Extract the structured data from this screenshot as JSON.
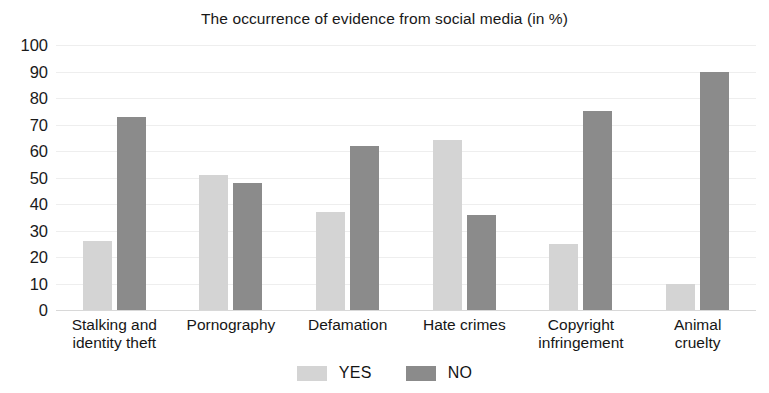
{
  "chart_data": {
    "type": "bar",
    "title": "The occurrence of evidence from social media (in %)",
    "xlabel": "",
    "ylabel": "",
    "ylim": [
      0,
      100
    ],
    "yticks": [
      0,
      10,
      20,
      30,
      40,
      50,
      60,
      70,
      80,
      90,
      100
    ],
    "ytick_labels": [
      "0",
      "10",
      "20",
      "30",
      "40",
      "50",
      "60",
      "70",
      "80",
      "90",
      "100"
    ],
    "grid": true,
    "legend_position": "bottom",
    "categories": [
      "Stalking and identity theft",
      "Pornography",
      "Defamation",
      "Hate crimes",
      "Copyright infringement",
      "Animal cruelty"
    ],
    "category_lines": [
      [
        "Stalking and",
        "identity theft"
      ],
      [
        "Pornography",
        ""
      ],
      [
        "Defamation",
        ""
      ],
      [
        "Hate crimes",
        ""
      ],
      [
        "Copyright",
        "infringement"
      ],
      [
        "Animal",
        "cruelty"
      ]
    ],
    "series": [
      {
        "name": "YES",
        "color": "#d4d4d4",
        "values": [
          26,
          51,
          37,
          64,
          25,
          10
        ]
      },
      {
        "name": "NO",
        "color": "#8b8b8b",
        "values": [
          73,
          48,
          62,
          36,
          75,
          90
        ]
      }
    ]
  },
  "legend": {
    "items": [
      {
        "label": "YES",
        "color": "#d4d4d4"
      },
      {
        "label": "NO",
        "color": "#8b8b8b"
      }
    ]
  }
}
